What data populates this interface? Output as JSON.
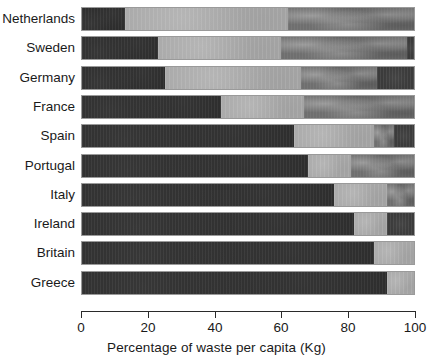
{
  "chart_data": {
    "type": "bar",
    "orientation": "horizontal",
    "stacked": true,
    "title": "",
    "xlabel": "Percentage of waste per capita (Kg)",
    "ylabel": "",
    "xlim": [
      0,
      100
    ],
    "xticks": [
      0,
      20,
      40,
      60,
      80,
      100
    ],
    "grid": false,
    "legend": "none",
    "categories": [
      "Netherlands",
      "Sweden",
      "Germany",
      "France",
      "Spain",
      "Portugal",
      "Italy",
      "Ireland",
      "Britain",
      "Greece"
    ],
    "series": [
      {
        "name": "segment-1",
        "color": "#2c2c2c",
        "values": [
          13,
          23,
          25,
          42,
          64,
          68,
          76,
          82,
          88,
          92
        ]
      },
      {
        "name": "segment-2",
        "color": "#a9a9a9",
        "values": [
          49,
          37,
          41,
          25,
          24,
          13,
          16,
          10,
          12,
          8
        ]
      },
      {
        "name": "segment-3",
        "color": "#6f6f6f",
        "values": [
          38,
          38,
          23,
          33,
          6,
          19,
          8,
          0,
          0,
          0
        ]
      },
      {
        "name": "segment-4",
        "color": "#3b3b3b",
        "values": [
          0,
          2,
          11,
          0,
          6,
          0,
          0,
          8,
          0,
          0
        ]
      }
    ],
    "bars": [
      {
        "label": "Netherlands",
        "segments": [
          13,
          49,
          38,
          0
        ],
        "boundaries": [
          13,
          62,
          100
        ]
      },
      {
        "label": "Sweden",
        "segments": [
          23,
          37,
          38,
          2
        ],
        "boundaries": [
          23,
          60,
          98,
          100
        ]
      },
      {
        "label": "Germany",
        "segments": [
          25,
          41,
          23,
          11
        ],
        "boundaries": [
          25,
          66,
          89,
          100
        ]
      },
      {
        "label": "France",
        "segments": [
          42,
          25,
          33,
          0
        ],
        "boundaries": [
          42,
          67,
          100
        ]
      },
      {
        "label": "Spain",
        "segments": [
          64,
          24,
          6,
          6
        ],
        "boundaries": [
          64,
          88,
          94,
          100
        ]
      },
      {
        "label": "Portugal",
        "segments": [
          68,
          13,
          19,
          0
        ],
        "boundaries": [
          68,
          81,
          100
        ]
      },
      {
        "label": "Italy",
        "segments": [
          76,
          16,
          8,
          0
        ],
        "boundaries": [
          76,
          92,
          100
        ]
      },
      {
        "label": "Ireland",
        "segments": [
          82,
          10,
          0,
          8
        ],
        "boundaries": [
          82,
          92,
          100
        ]
      },
      {
        "label": "Britain",
        "segments": [
          88,
          12,
          0,
          0
        ],
        "boundaries": [
          88,
          100
        ]
      },
      {
        "label": "Greece",
        "segments": [
          92,
          8,
          0,
          0
        ],
        "boundaries": [
          92,
          100
        ]
      }
    ],
    "axis": {
      "tick_labels": [
        "0",
        "20",
        "40",
        "60",
        "80",
        "100"
      ],
      "title": "Percentage of waste per capita (Kg)"
    },
    "colors": {
      "segment_1": "#2c2c2c",
      "segment_2": "#a9a9a9",
      "segment_3": "#6f6f6f",
      "segment_4": "#3b3b3b",
      "axis": "#2a2a2a",
      "background": "#ffffff",
      "bar_border": "#9a9a9a"
    }
  }
}
